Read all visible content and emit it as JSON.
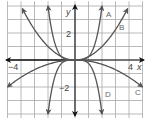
{
  "chart_data": {
    "type": "line",
    "title": "",
    "xlabel": "x",
    "ylabel": "y",
    "xlim": [
      -5,
      5
    ],
    "ylim": [
      -4,
      4
    ],
    "grid": true,
    "x_tick_labels": [
      {
        "value": -4,
        "label": "−4"
      },
      {
        "value": 4,
        "label": "4"
      }
    ],
    "y_tick_labels": [
      {
        "value": 2,
        "label": "2"
      },
      {
        "value": -2,
        "label": "−2"
      }
    ],
    "series": [
      {
        "name": "A",
        "formula": "y = 0.25x^4",
        "x": [
          -2,
          -1.5,
          -1,
          -0.5,
          0,
          0.5,
          1,
          1.5,
          2
        ],
        "values": [
          4,
          1.27,
          0.25,
          0.02,
          0,
          0.02,
          0.25,
          1.27,
          4
        ]
      },
      {
        "name": "B",
        "formula": "y = 0.25x^2",
        "x": [
          -3.9,
          -3,
          -2,
          -1,
          0,
          1,
          2,
          3,
          3.9
        ],
        "values": [
          3.8,
          2.25,
          1,
          0.25,
          0,
          0.25,
          1,
          2.25,
          3.8
        ]
      },
      {
        "name": "C",
        "formula": "y = -0.08x^2",
        "x": [
          -5,
          -4,
          -3,
          -2,
          -1,
          0,
          1,
          2,
          3,
          4,
          5
        ],
        "values": [
          -2,
          -1.28,
          -0.72,
          -0.32,
          -0.08,
          0,
          -0.08,
          -0.32,
          -0.72,
          -1.28,
          -2
        ]
      },
      {
        "name": "D",
        "formula": "y = -0.25x^4",
        "x": [
          -2,
          -1.5,
          -1,
          -0.5,
          0,
          0.5,
          1,
          1.5,
          2
        ],
        "values": [
          -4,
          -1.27,
          -0.25,
          -0.02,
          0,
          -0.02,
          -0.25,
          -1.27,
          -4
        ]
      }
    ]
  },
  "labels": {
    "x_axis": "x",
    "y_axis": "y",
    "tick_neg4": "−4",
    "tick_pos4": "4",
    "tick_pos2": "2",
    "tick_neg2": "−2",
    "curve_a": "A",
    "curve_b": "B",
    "curve_c": "C",
    "curve_d": "D"
  },
  "colors": {
    "grid": "#a8a8a8",
    "axes": "#111111",
    "curves": "#555555",
    "labels": "#666666"
  }
}
